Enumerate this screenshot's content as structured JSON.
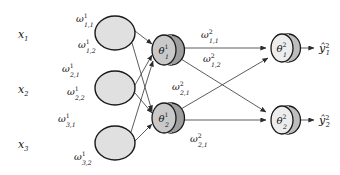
{
  "diagram": {
    "type": "neural-network-diagram",
    "background_color": "#ffffff",
    "edge_color": "#4a4a4a",
    "layers": [
      {
        "name": "input-layer",
        "nodes": [
          {
            "id": "x1",
            "base": "x",
            "sub": "1",
            "sup": "",
            "cx": 115,
            "cy": 33,
            "rx": 20,
            "ry": 17
          },
          {
            "id": "x2",
            "base": "x",
            "sub": "2",
            "sup": "",
            "cx": 115,
            "cy": 88,
            "rx": 20,
            "ry": 17
          },
          {
            "id": "x3",
            "base": "x",
            "sub": "3",
            "sup": "",
            "cx": 115,
            "cy": 143,
            "rx": 20,
            "ry": 17
          }
        ]
      },
      {
        "name": "hidden-layer",
        "nodes": [
          {
            "id": "theta-1-1",
            "base": "θ",
            "sub": "1",
            "sup": "1",
            "cx": 168,
            "cy": 50,
            "rx": 15,
            "ry": 15
          },
          {
            "id": "theta-1-2",
            "base": "θ",
            "sub": "2",
            "sup": "1",
            "cx": 168,
            "cy": 118,
            "rx": 15,
            "ry": 15
          }
        ]
      },
      {
        "name": "output-layer",
        "nodes": [
          {
            "id": "theta-2-1",
            "base": "θ",
            "sub": "1",
            "sup": "2",
            "cx": 285,
            "cy": 48,
            "rx": 14,
            "ry": 14
          },
          {
            "id": "theta-2-2",
            "base": "θ",
            "sub": "2",
            "sup": "2",
            "cx": 285,
            "cy": 120,
            "rx": 14,
            "ry": 14
          }
        ]
      }
    ],
    "outputs": [
      {
        "id": "yhat-1",
        "base": "ŷ",
        "sub": "1",
        "sup": "2",
        "x": 322,
        "y": 52
      },
      {
        "id": "yhat-2",
        "base": "ŷ",
        "sub": "2",
        "sup": "2",
        "x": 322,
        "y": 124
      }
    ],
    "input_labels": [
      {
        "id": "label-x1",
        "base": "x",
        "sub": "1",
        "x": 18,
        "y": 38
      },
      {
        "id": "label-x2",
        "base": "x",
        "sub": "2",
        "x": 18,
        "y": 93
      },
      {
        "id": "label-x3",
        "base": "x",
        "sub": "3",
        "x": 18,
        "y": 148
      }
    ],
    "weights_layer1": [
      {
        "id": "w1-1-1",
        "base": "ω",
        "sub": "1,1",
        "sup": "1",
        "x": 76,
        "y": 22,
        "from": "x1",
        "to": "theta-1-1"
      },
      {
        "id": "w1-1-2",
        "base": "ω",
        "sub": "1,2",
        "sup": "1",
        "x": 78,
        "y": 48,
        "from": "x1",
        "to": "theta-1-2"
      },
      {
        "id": "w1-2-1",
        "base": "ω",
        "sub": "2,1",
        "sup": "1",
        "x": 62,
        "y": 72,
        "from": "x2",
        "to": "theta-1-1"
      },
      {
        "id": "w1-2-2",
        "base": "ω",
        "sub": "2,2",
        "sup": "1",
        "x": 67,
        "y": 95,
        "from": "x2",
        "to": "theta-1-2"
      },
      {
        "id": "w1-3-1",
        "base": "ω",
        "sub": "3,1",
        "sup": "1",
        "x": 60,
        "y": 122,
        "from": "x3",
        "to": "theta-1-1"
      },
      {
        "id": "w1-3-2",
        "base": "ω",
        "sub": "3,2",
        "sup": "1",
        "x": 75,
        "y": 160,
        "from": "x3",
        "to": "theta-1-2"
      }
    ],
    "weights_layer2": [
      {
        "id": "w2-1-1",
        "base": "ω",
        "sub": "1,1",
        "sup": "2",
        "x": 201,
        "y": 38,
        "from": "theta-1-1",
        "to": "theta-2-1"
      },
      {
        "id": "w2-1-2",
        "base": "ω",
        "sub": "1,2",
        "sup": "2",
        "x": 203,
        "y": 62,
        "from": "theta-1-1",
        "to": "theta-2-2"
      },
      {
        "id": "w2-2-1-upper",
        "base": "ω",
        "sub": "2,1",
        "sup": "2",
        "x": 174,
        "y": 90,
        "from": "theta-1-2",
        "to": "theta-2-1"
      },
      {
        "id": "w2-2-1-lower",
        "base": "ω",
        "sub": "2,1",
        "sup": "2",
        "x": 190,
        "y": 142,
        "from": "theta-1-2",
        "to": "theta-2-2"
      }
    ],
    "edges": [
      {
        "id": "edge-x1-h1",
        "x1": 135,
        "y1": 31,
        "x2": 154,
        "y2": 44
      },
      {
        "id": "edge-x1-h2",
        "x1": 133,
        "y1": 42,
        "x2": 155,
        "y2": 111
      },
      {
        "id": "edge-x2-h1",
        "x1": 135,
        "y1": 86,
        "x2": 155,
        "y2": 56
      },
      {
        "id": "edge-x2-h2",
        "x1": 135,
        "y1": 94,
        "x2": 154,
        "y2": 113
      },
      {
        "id": "edge-x3-h1",
        "x1": 133,
        "y1": 134,
        "x2": 155,
        "y2": 60
      },
      {
        "id": "edge-x3-h2",
        "x1": 135,
        "y1": 143,
        "x2": 154,
        "y2": 124
      },
      {
        "id": "edge-h1-o1",
        "x1": 183,
        "y1": 48,
        "x2": 268,
        "y2": 48
      },
      {
        "id": "edge-h1-o2",
        "x1": 181,
        "y1": 58,
        "x2": 269,
        "y2": 114
      },
      {
        "id": "edge-h2-o1",
        "x1": 181,
        "y1": 110,
        "x2": 270,
        "y2": 58
      },
      {
        "id": "edge-h2-o2",
        "x1": 183,
        "y1": 120,
        "x2": 269,
        "y2": 120
      },
      {
        "id": "edge-o1-y1",
        "x1": 299,
        "y1": 48,
        "x2": 316,
        "y2": 48
      },
      {
        "id": "edge-o2-y2",
        "x1": 299,
        "y1": 120,
        "x2": 316,
        "y2": 120
      }
    ]
  }
}
